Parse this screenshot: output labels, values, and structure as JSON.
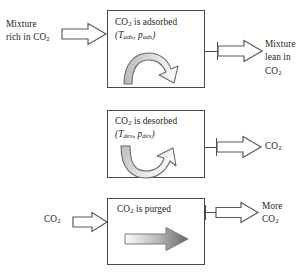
{
  "diagram": {
    "background_color": "#ffffff",
    "stroke_color": "#4a4a4a",
    "text_color": "#231f20",
    "rows": [
      {
        "id": "adsorption",
        "box": {
          "line1": "CO",
          "line1_sub": "2",
          "line1_rest": " is adsorbed",
          "condition_open": "(",
          "condition_t": "T",
          "condition_t_sub": "ads",
          "condition_sep": ", ",
          "condition_p": "p",
          "condition_p_sub": "ads",
          "condition_close": ")"
        },
        "inner_arrow": "curved-arch-arrow-right",
        "input": {
          "label_lines": [
            "Mixture",
            "rich in CO"
          ],
          "label_sub": "2",
          "arrow": "block-arrow-right-outline"
        },
        "output": {
          "label_lines": [
            "Mixture",
            "lean in",
            "CO"
          ],
          "label_sub": "2",
          "arrow": "block-arrow-right-outline"
        }
      },
      {
        "id": "desorption",
        "box": {
          "line1": "CO",
          "line1_sub": "2",
          "line1_rest": " is desorbed",
          "condition_open": "(",
          "condition_t": "T",
          "condition_t_sub": "des",
          "condition_sep": ", ",
          "condition_p": "p",
          "condition_p_sub": "des",
          "condition_close": ")"
        },
        "inner_arrow": "curved-u-arrow-up-right",
        "input": null,
        "output": {
          "label_lines": [
            "CO"
          ],
          "label_sub": "2",
          "arrow": "block-arrow-right-outline"
        }
      },
      {
        "id": "purge",
        "box": {
          "line1": "CO",
          "line1_sub": "2",
          "line1_rest": " is purged",
          "condition_open": "",
          "condition_t": "",
          "condition_t_sub": "",
          "condition_sep": "",
          "condition_p": "",
          "condition_p_sub": "",
          "condition_close": ""
        },
        "inner_arrow": "straight-arrow-right-gradient",
        "input": {
          "label_lines": [
            "CO"
          ],
          "label_sub": "2",
          "arrow": "block-arrow-right-outline"
        },
        "output": {
          "label_lines": [
            "More",
            "CO"
          ],
          "label_sub": "2",
          "arrow": "block-arrow-right-outline"
        }
      }
    ]
  }
}
